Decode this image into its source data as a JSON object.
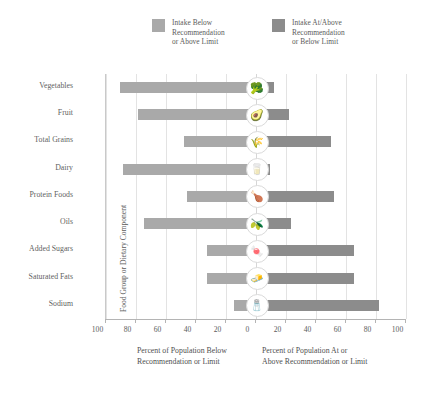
{
  "legend": [
    {
      "label": "Intake Below\nRecommendation\nor Above Limit",
      "color": "#a9a9a9",
      "key": "below"
    },
    {
      "label": "Intake At/Above\nRecommendation\nor Below Limit",
      "color": "#8c8c8c",
      "key": "atabove"
    }
  ],
  "axis": {
    "y_title": "Food Group or Dietary Component",
    "x_caption_left": "Percent of Population Below\nRecommendation or Limit",
    "x_caption_right": "Percent of Population At or\nAbove Recommendation or Limit",
    "ticks": [
      "100",
      "80",
      "60",
      "40",
      "20",
      "0",
      "20",
      "40",
      "60",
      "80",
      "100"
    ]
  },
  "chart_data": {
    "type": "bar",
    "orientation": "horizontal",
    "subtype": "diverging-tornado",
    "title": "",
    "xlabel": "Percent of Population",
    "ylabel": "Food Group or Dietary Component",
    "xlim": [
      -100,
      100
    ],
    "xticks": [
      -100,
      -80,
      -60,
      -40,
      -20,
      0,
      20,
      40,
      60,
      80,
      100
    ],
    "grid": true,
    "legend_position": "top",
    "categories": [
      "Vegetables",
      "Fruit",
      "Total Grains",
      "Dairy",
      "Protein Foods",
      "Oils",
      "Added Sugars",
      "Saturated Fats",
      "Sodium"
    ],
    "series": [
      {
        "name": "Intake Below Recommendation or Above Limit",
        "color": "#a9a9a9",
        "values": [
          91,
          79,
          48,
          89,
          46,
          75,
          33,
          33,
          15
        ]
      },
      {
        "name": "Intake At/Above Recommendation or Below Limit",
        "color": "#8c8c8c",
        "values": [
          12,
          22,
          50,
          9,
          52,
          23,
          65,
          65,
          82
        ]
      }
    ],
    "annotations": [
      {
        "category": "Vegetables",
        "icon": "broccoli-icon",
        "glyph": "🥦"
      },
      {
        "category": "Fruit",
        "icon": "fruit-icon",
        "glyph": "🥑"
      },
      {
        "category": "Total Grains",
        "icon": "grains-icon",
        "glyph": "🌾"
      },
      {
        "category": "Dairy",
        "icon": "dairy-icon",
        "glyph": "🥛"
      },
      {
        "category": "Protein Foods",
        "icon": "protein-icon",
        "glyph": "🍗"
      },
      {
        "category": "Oils",
        "icon": "oils-icon",
        "glyph": "🫒"
      },
      {
        "category": "Added Sugars",
        "icon": "sugar-icon",
        "glyph": "🍬"
      },
      {
        "category": "Saturated Fats",
        "icon": "fats-icon",
        "glyph": "🧈"
      },
      {
        "category": "Sodium",
        "icon": "salt-icon",
        "glyph": "🧂"
      }
    ]
  }
}
